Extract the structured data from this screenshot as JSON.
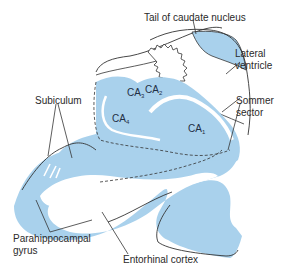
{
  "diagram": {
    "colors": {
      "fill": "#a9d1ec",
      "line": "#333333",
      "background": "#ffffff"
    },
    "labels": {
      "tail_caudate": "Tail of caudate nucleus",
      "lateral_ventricle_1": "Lateral",
      "lateral_ventricle_2": "ventricle",
      "sommer_1": "Sommer",
      "sommer_2": "sector",
      "subiculum": "Subiculum",
      "parahippocampal_1": "Parahippocampal",
      "parahippocampal_2": "gyrus",
      "entorhinal": "Entorhinal cortex"
    },
    "regions": {
      "ca1": {
        "base": "CA",
        "sub": "1"
      },
      "ca2": {
        "base": "CA",
        "sub": "2"
      },
      "ca3": {
        "base": "CA",
        "sub": "3"
      },
      "ca4": {
        "base": "CA",
        "sub": "4"
      }
    }
  }
}
